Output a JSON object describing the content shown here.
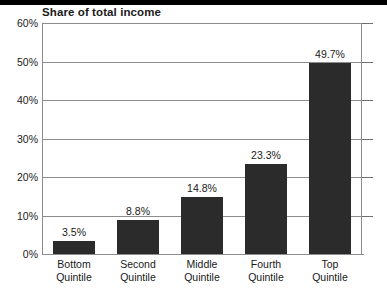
{
  "chart_data": {
    "type": "bar",
    "title": "Share of total income",
    "xlabel": "",
    "ylabel": "",
    "ylim": [
      0,
      60
    ],
    "grid": true,
    "legend": false,
    "categories": [
      "Bottom Quintile",
      "Second Quintile",
      "Middle Quintile",
      "Fourth Quintile",
      "Top Quintile"
    ],
    "category_lines": [
      {
        "line1": "Bottom",
        "line2": "Quintile"
      },
      {
        "line1": "Second",
        "line2": "Quintile"
      },
      {
        "line1": "Middle",
        "line2": "Quintile"
      },
      {
        "line1": "Fourth",
        "line2": "Quintile"
      },
      {
        "line1": "Top",
        "line2": "Quintile"
      }
    ],
    "values": [
      3.5,
      8.8,
      14.8,
      23.3,
      49.7
    ],
    "value_labels": [
      "3.5%",
      "8.8%",
      "14.8%",
      "23.3%",
      "49.7%"
    ],
    "y_ticks": [
      0,
      10,
      20,
      30,
      40,
      50,
      60
    ],
    "y_tick_labels": [
      "0%",
      "10%",
      "20%",
      "30%",
      "40%",
      "50%",
      "60%"
    ],
    "bar_color": "#2b2b2b",
    "grid_color": "#8c8c8c",
    "text_color": "#1a1a1a"
  }
}
